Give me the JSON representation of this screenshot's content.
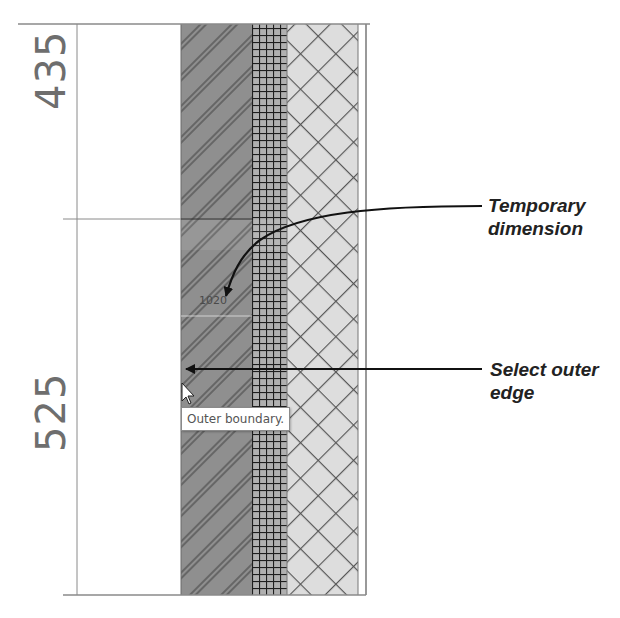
{
  "view": {
    "type": "wall-section-detail",
    "dimensions": [
      {
        "name": "upper-segment",
        "value": "435"
      },
      {
        "name": "lower-segment",
        "value": "525"
      }
    ],
    "temporary_dimension": {
      "value": "1020"
    },
    "tooltip": {
      "text": "Outer boundary."
    },
    "layers": [
      {
        "name": "masonry-diagonal-hatch",
        "fill": "#8f8f8f"
      },
      {
        "name": "grid-hatch",
        "fill": "#a9a9a9"
      },
      {
        "name": "insulation-cross-hatch",
        "fill": "#dcdcdc"
      },
      {
        "name": "finish-layer",
        "fill": "#ffffff"
      }
    ]
  },
  "callouts": [
    {
      "id": "temporary-dimension",
      "lines": [
        "Temporary",
        "dimension"
      ]
    },
    {
      "id": "select-outer-edge",
      "lines": [
        "Select outer",
        "edge"
      ]
    }
  ],
  "colors": {
    "line": "#8a8a8a",
    "arrow": "#111111",
    "dim_text": "#6e6e6e"
  }
}
